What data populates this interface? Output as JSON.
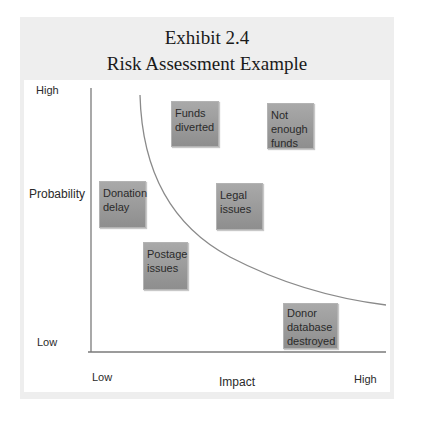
{
  "exhibit_label": "Exhibit 2.4",
  "title": "Risk Assessment Example",
  "y_axis": {
    "label": "Probability",
    "high": "High",
    "low": "Low"
  },
  "x_axis": {
    "label": "Impact",
    "low": "Low",
    "high": "High"
  },
  "risks": [
    {
      "label": "Funds diverted",
      "impact": "medium-low",
      "probability": "high"
    },
    {
      "label": "Not enough funds",
      "impact": "medium-high",
      "probability": "high"
    },
    {
      "label": "Donation delay",
      "impact": "low",
      "probability": "medium"
    },
    {
      "label": "Legal issues",
      "impact": "medium",
      "probability": "medium"
    },
    {
      "label": "Postage issues",
      "impact": "low-medium",
      "probability": "medium-low"
    },
    {
      "label": "Donor database destroyed",
      "impact": "high",
      "probability": "low"
    }
  ],
  "colors": {
    "box_fill": "#9c9c9c",
    "panel": "#eeeeee",
    "axis": "#7a7a7a",
    "curve": "#8a8a8a"
  }
}
